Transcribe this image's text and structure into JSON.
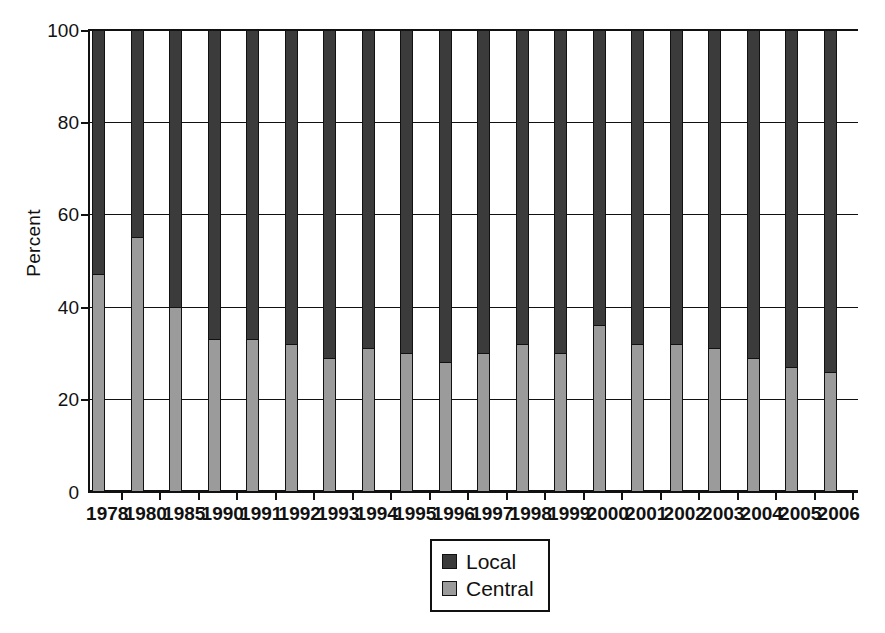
{
  "chart_data": {
    "type": "bar",
    "subtype": "stacked-100-percent",
    "title": "",
    "xlabel": "",
    "ylabel": "Percent",
    "ylim": [
      0,
      100
    ],
    "yticks": [
      0,
      20,
      40,
      60,
      80,
      100
    ],
    "grid": true,
    "legend_position": "bottom-center",
    "categories": [
      "1978",
      "1980",
      "1985",
      "1990",
      "1991",
      "1992",
      "1993",
      "1994",
      "1995",
      "1996",
      "1997",
      "1998",
      "1999",
      "2000",
      "2001",
      "2002",
      "2003",
      "2004",
      "2005",
      "2006"
    ],
    "series": [
      {
        "name": "Central",
        "color": "#9b9b9b",
        "values": [
          47,
          55,
          40,
          33,
          33,
          32,
          29,
          31,
          30,
          28,
          30,
          32,
          30,
          36,
          32,
          32,
          31,
          29,
          27,
          26
        ]
      },
      {
        "name": "Local",
        "color": "#3b3b3b",
        "values": [
          53,
          45,
          60,
          67,
          67,
          68,
          71,
          69,
          70,
          72,
          70,
          68,
          70,
          64,
          68,
          68,
          69,
          71,
          73,
          74
        ]
      }
    ]
  },
  "axes": {
    "y_title": "Percent",
    "y_tick_labels": [
      "0",
      "20",
      "40",
      "60",
      "80",
      "100"
    ],
    "x_tick_labels": [
      "1978",
      "1980",
      "1985",
      "1990",
      "1991",
      "1992",
      "1993",
      "1994",
      "1995",
      "1996",
      "1997",
      "1998",
      "1999",
      "2000",
      "2001",
      "2002",
      "2003",
      "2004",
      "2005",
      "2006"
    ]
  },
  "legend": {
    "entries": [
      {
        "label": "Local",
        "color": "#3b3b3b"
      },
      {
        "label": "Central",
        "color": "#9b9b9b"
      }
    ]
  }
}
